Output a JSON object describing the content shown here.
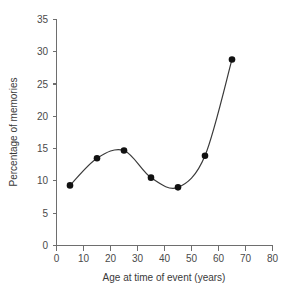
{
  "chart_data": {
    "type": "line",
    "title": "",
    "subtitle": "",
    "xlabel": "Age at time of event (years)",
    "ylabel": "Percentage of memories",
    "x": [
      5,
      15,
      25,
      35,
      45,
      55,
      65
    ],
    "values": [
      9.3,
      13.5,
      14.7,
      10.5,
      9.0,
      13.9,
      28.8
    ],
    "series": [
      {
        "name": "Percentage of memories",
        "x": [
          5,
          15,
          25,
          35,
          45,
          55,
          65
        ],
        "values": [
          9.3,
          13.5,
          14.7,
          10.5,
          9.0,
          13.9,
          28.8
        ]
      }
    ],
    "xlim": [
      0,
      80
    ],
    "ylim": [
      0,
      35
    ],
    "xticks": [
      0,
      10,
      20,
      30,
      40,
      50,
      60,
      70,
      80
    ],
    "yticks": [
      0,
      5,
      10,
      15,
      20,
      25,
      30,
      35
    ],
    "xtick_labels": [
      "0",
      "10",
      "20",
      "30",
      "40",
      "50",
      "60",
      "70",
      "80"
    ],
    "ytick_labels": [
      "0",
      "5",
      "10",
      "15",
      "20",
      "25",
      "30",
      "35"
    ],
    "grid": false,
    "legend": "none",
    "marker": "filled-circle",
    "interpolation": "smooth",
    "line_color": "#3a3a3a",
    "marker_color": "#111111",
    "axis_color": "#6e6e6e",
    "background_color": "#ffffff",
    "annotations": []
  },
  "axes": {
    "x_title": "Age at time of event (years)",
    "y_title": "Percentage of memories"
  }
}
